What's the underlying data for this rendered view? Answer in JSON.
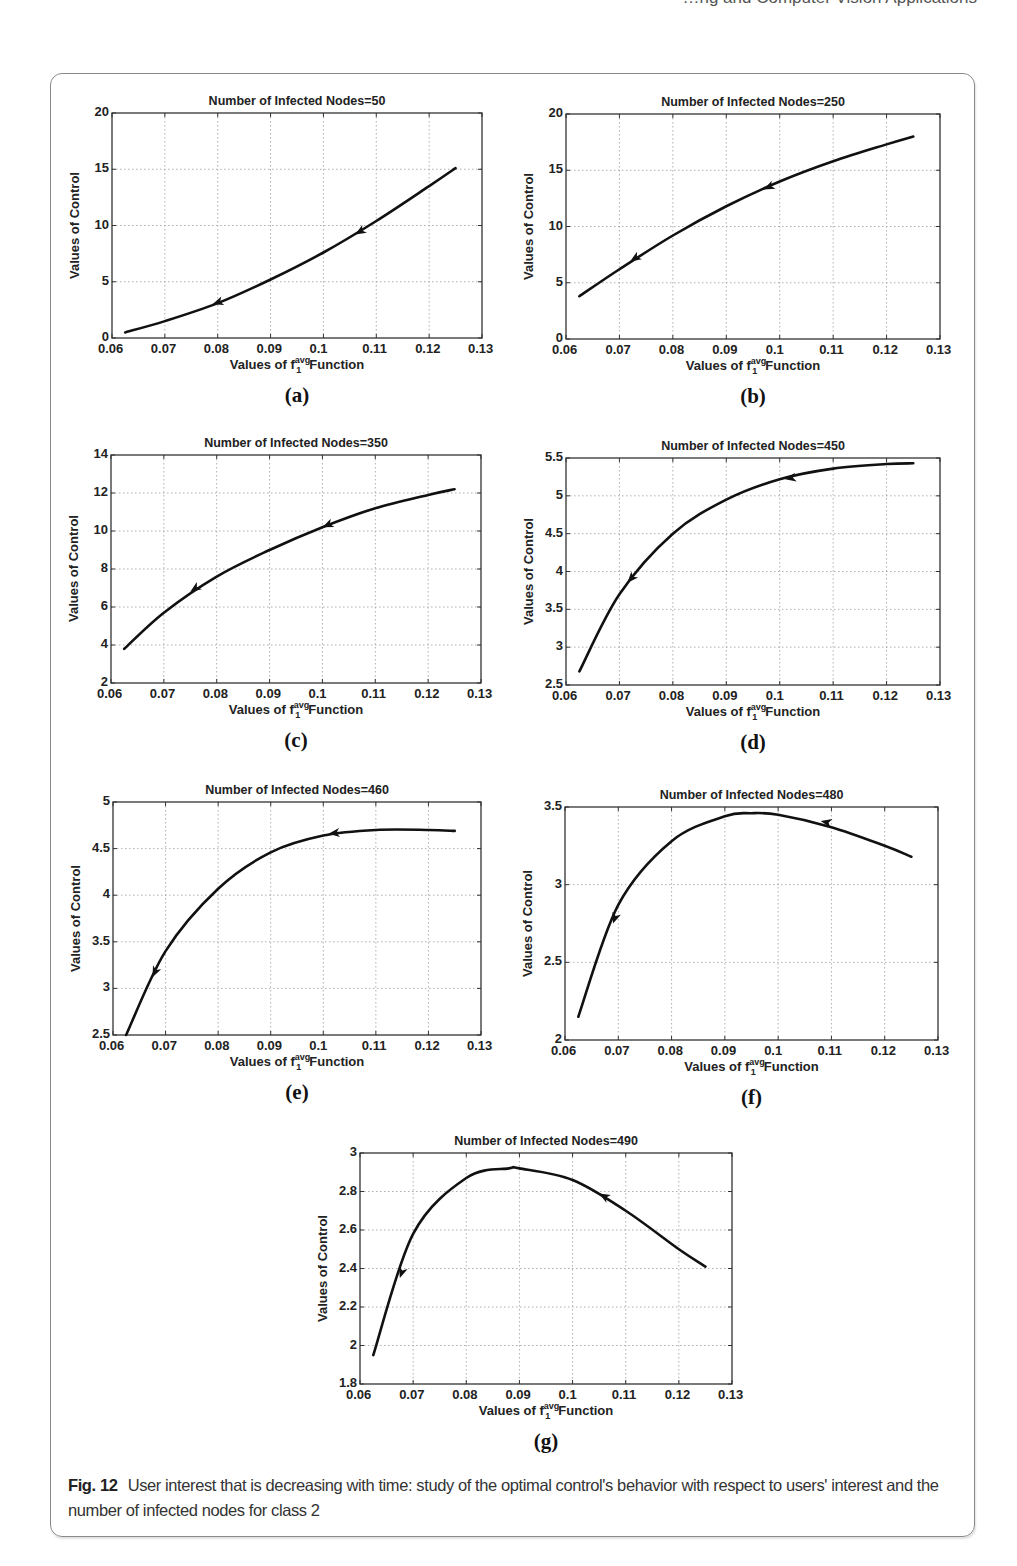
{
  "header": {
    "running_text": "…ng and Computer Vision Applications"
  },
  "figure": {
    "number_label": "Fig. 12",
    "caption": "User interest that is decreasing with time: study of the optimal control's behavior with respect to users' interest and the number of infected nodes for class 2"
  },
  "axis_text": {
    "ylabel": "Values of Control",
    "xlabel_prefix": "Values of f",
    "xlabel_sup": "avg",
    "xlabel_sub": "1",
    "xlabel_suffix": "Function"
  },
  "panels": [
    {
      "id": "a",
      "label": "(a)",
      "title": "Number of Infected Nodes=50",
      "box": {
        "left": 112,
        "top": 113,
        "right": 482,
        "bottom": 338
      }
    },
    {
      "id": "b",
      "label": "(b)",
      "title": "Number of Infected Nodes=250",
      "box": {
        "left": 566,
        "top": 114,
        "right": 940,
        "bottom": 339
      }
    },
    {
      "id": "c",
      "label": "(c)",
      "title": "Number of Infected Nodes=350",
      "box": {
        "left": 111,
        "top": 455,
        "right": 481,
        "bottom": 683
      }
    },
    {
      "id": "d",
      "label": "(d)",
      "title": "Number of Infected Nodes=450",
      "box": {
        "left": 566,
        "top": 458,
        "right": 940,
        "bottom": 685
      }
    },
    {
      "id": "e",
      "label": "(e)",
      "title": "Number of Infected Nodes=460",
      "box": {
        "left": 113,
        "top": 802,
        "right": 481,
        "bottom": 1035
      }
    },
    {
      "id": "f",
      "label": "(f)",
      "title": "Number of Infected Nodes=480",
      "box": {
        "left": 565,
        "top": 807,
        "right": 938,
        "bottom": 1040
      }
    },
    {
      "id": "g",
      "label": "(g)",
      "title": "Number of Infected Nodes=490",
      "box": {
        "left": 360,
        "top": 1153,
        "right": 732,
        "bottom": 1384
      }
    }
  ],
  "chart_data": [
    {
      "type": "line",
      "panel": "a",
      "title": "Number of Infected Nodes=50",
      "xlabel": "Values of f_1^avg Function",
      "ylabel": "Values of Control",
      "xlim": [
        0.06,
        0.13
      ],
      "ylim": [
        0,
        20
      ],
      "xticks": [
        "0.06",
        "0.07",
        "0.08",
        "0.09",
        "0.1",
        "0.11",
        "0.12",
        "0.13"
      ],
      "yticks": [
        "0",
        "5",
        "10",
        "15",
        "20"
      ],
      "grid": true,
      "x": [
        0.0625,
        0.07,
        0.08,
        0.09,
        0.1,
        0.11,
        0.12,
        0.125
      ],
      "y": [
        0.5,
        1.5,
        3.1,
        5.2,
        7.6,
        10.4,
        13.5,
        15.1
      ],
      "arrows": [
        {
          "x": 0.079,
          "y": 3.0
        },
        {
          "x": 0.106,
          "y": 9.2
        }
      ]
    },
    {
      "type": "line",
      "panel": "b",
      "title": "Number of Infected Nodes=250",
      "xlabel": "Values of f_1^avg Function",
      "ylabel": "Values of Control",
      "xlim": [
        0.06,
        0.13
      ],
      "ylim": [
        0,
        20
      ],
      "xticks": [
        "0.06",
        "0.07",
        "0.08",
        "0.09",
        "0.1",
        "0.11",
        "0.12",
        "0.13"
      ],
      "yticks": [
        "0",
        "5",
        "10",
        "15",
        "20"
      ],
      "grid": true,
      "x": [
        0.0625,
        0.07,
        0.08,
        0.09,
        0.1,
        0.11,
        0.12,
        0.125
      ],
      "y": [
        3.8,
        6.2,
        9.2,
        11.8,
        14.0,
        15.8,
        17.3,
        18.0
      ],
      "arrows": [
        {
          "x": 0.072,
          "y": 6.9
        },
        {
          "x": 0.097,
          "y": 13.3
        }
      ]
    },
    {
      "type": "line",
      "panel": "c",
      "title": "Number of Infected Nodes=350",
      "xlabel": "Values of f_1^avg Function",
      "ylabel": "Values of Control",
      "xlim": [
        0.06,
        0.13
      ],
      "ylim": [
        2,
        14
      ],
      "xticks": [
        "0.06",
        "0.07",
        "0.08",
        "0.09",
        "0.1",
        "0.11",
        "0.12",
        "0.13"
      ],
      "yticks": [
        "2",
        "4",
        "6",
        "8",
        "10",
        "12",
        "14"
      ],
      "grid": true,
      "x": [
        0.0625,
        0.07,
        0.08,
        0.09,
        0.1,
        0.11,
        0.12,
        0.125
      ],
      "y": [
        3.8,
        5.7,
        7.6,
        9.0,
        10.2,
        11.2,
        11.9,
        12.2
      ],
      "arrows": [
        {
          "x": 0.075,
          "y": 6.8
        },
        {
          "x": 0.1,
          "y": 10.2
        }
      ]
    },
    {
      "type": "line",
      "panel": "d",
      "title": "Number of Infected Nodes=450",
      "xlabel": "Values of f_1^avg Function",
      "ylabel": "Values of Control",
      "xlim": [
        0.06,
        0.13
      ],
      "ylim": [
        2.5,
        5.5
      ],
      "xticks": [
        "0.06",
        "0.07",
        "0.08",
        "0.09",
        "0.1",
        "0.11",
        "0.12",
        "0.13"
      ],
      "yticks": [
        "2.5",
        "3",
        "3.5",
        "4",
        "4.5",
        "5",
        "5.5"
      ],
      "grid": true,
      "x": [
        0.0625,
        0.07,
        0.08,
        0.09,
        0.1,
        0.11,
        0.12,
        0.125
      ],
      "y": [
        2.68,
        3.7,
        4.5,
        4.95,
        5.22,
        5.36,
        5.42,
        5.43
      ],
      "arrows": [
        {
          "x": 0.0715,
          "y": 3.85
        },
        {
          "x": 0.101,
          "y": 5.22
        }
      ]
    },
    {
      "type": "line",
      "panel": "e",
      "title": "Number of Infected Nodes=460",
      "xlabel": "Values of f_1^avg Function",
      "ylabel": "Values of Control",
      "xlim": [
        0.06,
        0.13
      ],
      "ylim": [
        2.5,
        5
      ],
      "xticks": [
        "0.06",
        "0.07",
        "0.08",
        "0.09",
        "0.1",
        "0.11",
        "0.12",
        "0.13"
      ],
      "yticks": [
        "2.5",
        "3",
        "3.5",
        "4",
        "4.5",
        "5"
      ],
      "grid": true,
      "x": [
        0.0625,
        0.07,
        0.08,
        0.09,
        0.1,
        0.11,
        0.12,
        0.125
      ],
      "y": [
        2.5,
        3.4,
        4.07,
        4.46,
        4.64,
        4.7,
        4.7,
        4.69
      ],
      "arrows": [
        {
          "x": 0.0675,
          "y": 3.12
        },
        {
          "x": 0.101,
          "y": 4.66
        }
      ]
    },
    {
      "type": "line",
      "panel": "f",
      "title": "Number of Infected Nodes=480",
      "xlabel": "Values of f_1^avg Function",
      "ylabel": "Values of Control",
      "xlim": [
        0.06,
        0.13
      ],
      "ylim": [
        2,
        3.5
      ],
      "xticks": [
        "0.06",
        "0.07",
        "0.08",
        "0.09",
        "0.1",
        "0.11",
        "0.12",
        "0.13"
      ],
      "yticks": [
        "2",
        "2.5",
        "3",
        "3.5"
      ],
      "grid": true,
      "x": [
        0.0625,
        0.07,
        0.08,
        0.09,
        0.095,
        0.1,
        0.11,
        0.12,
        0.125
      ],
      "y": [
        2.15,
        2.87,
        3.28,
        3.44,
        3.46,
        3.45,
        3.37,
        3.25,
        3.18
      ],
      "arrows": [
        {
          "x": 0.069,
          "y": 2.75
        },
        {
          "x": 0.108,
          "y": 3.41
        }
      ]
    },
    {
      "type": "line",
      "panel": "g",
      "title": "Number of Infected Nodes=490",
      "xlabel": "Values of f_1^avg Function",
      "ylabel": "Values of Control",
      "xlim": [
        0.06,
        0.13
      ],
      "ylim": [
        1.8,
        3
      ],
      "xticks": [
        "0.06",
        "0.07",
        "0.08",
        "0.09",
        "0.1",
        "0.11",
        "0.12",
        "0.13"
      ],
      "yticks": [
        "1.8",
        "2",
        "2.2",
        "2.4",
        "2.6",
        "2.8",
        "3"
      ],
      "grid": true,
      "x": [
        0.0625,
        0.07,
        0.08,
        0.088,
        0.09,
        0.1,
        0.11,
        0.12,
        0.125
      ],
      "y": [
        1.95,
        2.58,
        2.87,
        2.92,
        2.92,
        2.86,
        2.7,
        2.5,
        2.41
      ],
      "arrows": [
        {
          "x": 0.0675,
          "y": 2.35
        },
        {
          "x": 0.105,
          "y": 2.79
        }
      ]
    }
  ]
}
